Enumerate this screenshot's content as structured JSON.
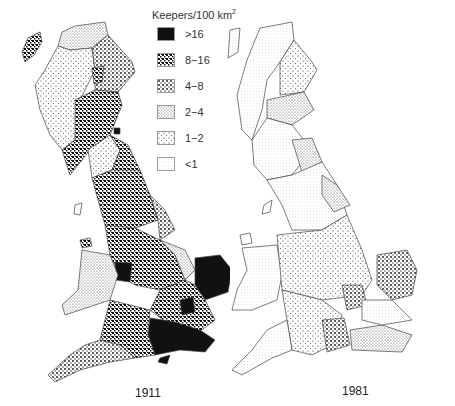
{
  "legend": {
    "title": "Keepers/100 km",
    "title_superscript": "2",
    "items": [
      {
        "label": ">16",
        "pattern": "p16"
      },
      {
        "label": "8−16",
        "pattern": "p8"
      },
      {
        "label": "4−8",
        "pattern": "p4"
      },
      {
        "label": "2−4",
        "pattern": "p2"
      },
      {
        "label": "1−2",
        "pattern": "p1"
      },
      {
        "label": "<1",
        "pattern": "p0"
      }
    ]
  },
  "maps": [
    {
      "caption": "1911",
      "region": "Great Britain",
      "dominant_classes": [
        "8−16",
        "4−8",
        ">16"
      ]
    },
    {
      "caption": "1981",
      "region": "Great Britain",
      "dominant_classes": [
        "<1",
        "1−2",
        "2−4"
      ]
    }
  ],
  "colors": {
    "ink": "#111111",
    "outline": "#444444",
    "background": "#ffffff"
  }
}
